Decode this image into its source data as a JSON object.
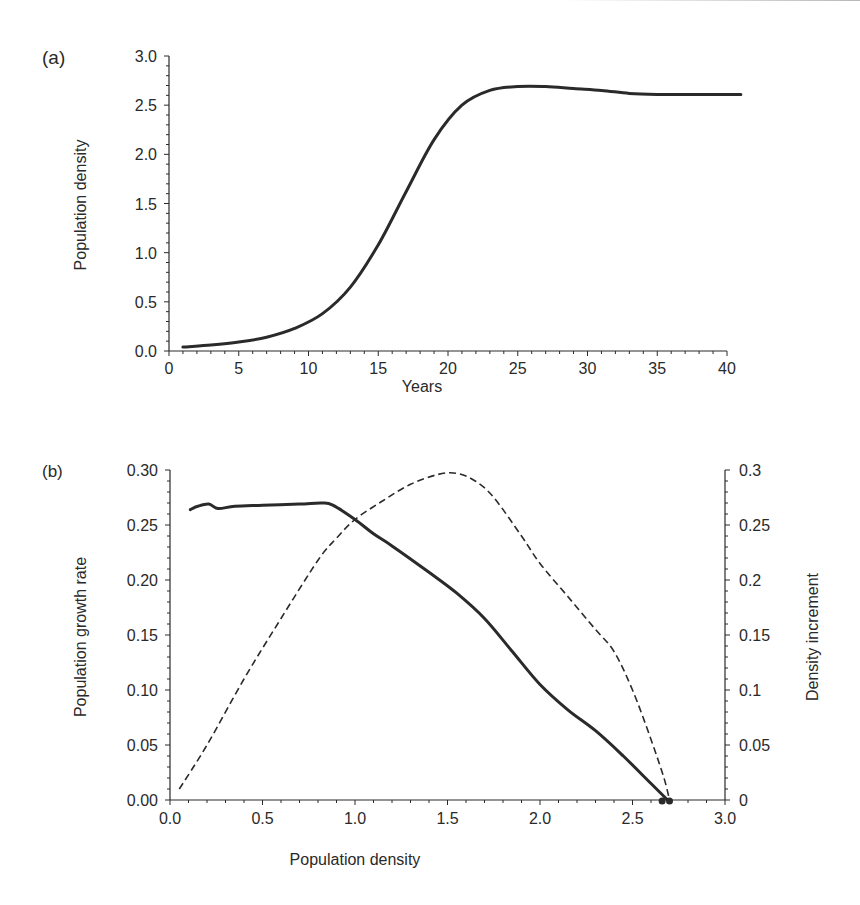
{
  "chart_data": [
    {
      "panel": "(a)",
      "type": "line",
      "title": "",
      "xlabel": "Years",
      "ylabel": "Population density",
      "xlim": [
        0,
        40
      ],
      "ylim": [
        0,
        3.0
      ],
      "xticks": [
        "0",
        "5",
        "10",
        "15",
        "20",
        "25",
        "30",
        "35",
        "40"
      ],
      "yticks": [
        "0.0",
        "0.5",
        "1.0",
        "1.5",
        "2.0",
        "2.5",
        "3.0"
      ],
      "grid": false,
      "series": [
        {
          "name": "Population density",
          "style": "solid",
          "color": "#2a2a2a",
          "x": [
            1,
            3,
            5,
            7,
            9,
            11,
            13,
            15,
            17,
            19,
            21,
            23,
            25,
            27,
            29,
            31,
            33,
            35,
            37,
            39,
            41
          ],
          "y": [
            0.04,
            0.06,
            0.09,
            0.14,
            0.23,
            0.38,
            0.65,
            1.08,
            1.62,
            2.15,
            2.5,
            2.65,
            2.69,
            2.69,
            2.67,
            2.65,
            2.62,
            2.61,
            2.61,
            2.61,
            2.61
          ]
        }
      ]
    },
    {
      "panel": "(b)",
      "type": "line",
      "title": "",
      "xlabel": "Population density",
      "ylabel": "Population growth rate",
      "y2label": "Density increment",
      "xlim": [
        0,
        3.0
      ],
      "ylim": [
        0,
        0.3
      ],
      "y2lim": [
        0,
        0.3
      ],
      "xticks": [
        "0.0",
        "0.5",
        "1.0",
        "1.5",
        "2.0",
        "2.5",
        "3.0"
      ],
      "yticks": [
        "0.00",
        "0.05",
        "0.10",
        "0.15",
        "0.20",
        "0.25",
        "0.30"
      ],
      "y2ticks": [
        "0",
        "0.05",
        "0.1",
        "0.15",
        "0.2",
        "0.25",
        "0.3"
      ],
      "grid": false,
      "series": [
        {
          "name": "Population growth rate",
          "axis": "left",
          "style": "solid",
          "color": "#2a2a2a",
          "x": [
            0.11,
            0.15,
            0.21,
            0.26,
            0.35,
            0.5,
            0.7,
            0.82,
            0.88,
            1.0,
            1.1,
            1.2,
            1.4,
            1.55,
            1.7,
            1.85,
            2.0,
            2.15,
            2.3,
            2.45,
            2.6,
            2.69
          ],
          "y": [
            0.264,
            0.267,
            0.269,
            0.265,
            0.267,
            0.268,
            0.269,
            0.27,
            0.268,
            0.255,
            0.242,
            0.231,
            0.207,
            0.188,
            0.165,
            0.135,
            0.105,
            0.082,
            0.063,
            0.04,
            0.015,
            0.0
          ]
        },
        {
          "name": "Density increment",
          "axis": "right",
          "style": "dashed",
          "color": "#2a2a2a",
          "x": [
            0.05,
            0.2,
            0.4,
            0.6,
            0.8,
            0.9,
            1.0,
            1.15,
            1.3,
            1.45,
            1.55,
            1.65,
            1.75,
            1.9,
            2.0,
            2.15,
            2.3,
            2.4,
            2.5,
            2.6,
            2.67,
            2.7
          ],
          "y": [
            0.01,
            0.05,
            0.11,
            0.165,
            0.218,
            0.238,
            0.255,
            0.272,
            0.287,
            0.296,
            0.297,
            0.29,
            0.275,
            0.24,
            0.215,
            0.185,
            0.155,
            0.135,
            0.1,
            0.055,
            0.02,
            0.0
          ]
        }
      ],
      "markers": [
        {
          "name": "equilibrium-point-1",
          "x": 2.66,
          "y": 0
        },
        {
          "name": "equilibrium-point-2",
          "x": 2.7,
          "y": 0
        }
      ]
    }
  ]
}
